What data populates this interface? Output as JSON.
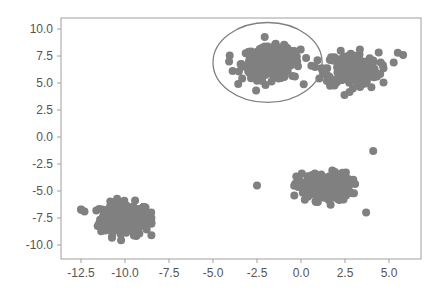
{
  "chart_data": {
    "type": "scatter",
    "title": "",
    "xlabel": "",
    "ylabel": "",
    "xlim": [
      -13.6,
      6.8
    ],
    "ylim": [
      -11.2,
      11.0
    ],
    "grid": false,
    "legend": null,
    "x_ticks": [
      "-12.5",
      "-10.0",
      "-7.5",
      "-5.0",
      "-2.5",
      "0.0",
      "2.5",
      "5.0"
    ],
    "y_ticks": [
      "10.0",
      "7.5",
      "5.0",
      "2.5",
      "0.0",
      "-2.5",
      "-5.0",
      "-7.5",
      "-10.0"
    ],
    "x_tick_values": [
      -12.5,
      -10.0,
      -7.5,
      -5.0,
      -2.5,
      0.0,
      2.5,
      5.0
    ],
    "y_tick_values": [
      10.0,
      7.5,
      5.0,
      2.5,
      0.0,
      -2.5,
      -5.0,
      -7.5,
      -10.0
    ],
    "point_color": "#808080",
    "frame_color": "#a0a0a0",
    "clusters": [
      {
        "name": "cluster-1",
        "center": [
          -10.0,
          -7.6
        ],
        "spread": [
          0.95,
          1.0
        ],
        "count": 220,
        "x_range": [
          -12.7,
          -8.5
        ],
        "y_range": [
          -10.0,
          -5.0
        ]
      },
      {
        "name": "cluster-2",
        "center": [
          -1.7,
          6.8
        ],
        "spread": [
          1.1,
          1.0
        ],
        "count": 250,
        "x_range": [
          -4.4,
          0.9
        ],
        "y_range": [
          4.3,
          9.4
        ]
      },
      {
        "name": "cluster-3",
        "center": [
          2.9,
          6.3
        ],
        "spread": [
          1.0,
          1.0
        ],
        "count": 250,
        "x_range": [
          0.8,
          5.8
        ],
        "y_range": [
          3.9,
          9.9
        ]
      },
      {
        "name": "cluster-4",
        "center": [
          1.3,
          -4.6
        ],
        "spread": [
          1.0,
          0.85
        ],
        "count": 230,
        "x_range": [
          -2.5,
          4.2
        ],
        "y_range": [
          -7.2,
          -1.3
        ]
      }
    ],
    "outliers": [
      [
        4.1,
        -1.3
      ],
      [
        -2.5,
        -4.5
      ],
      [
        3.7,
        -7.0
      ],
      [
        -12.5,
        -6.7
      ],
      [
        -12.3,
        -6.9
      ],
      [
        -8.5,
        -7.5
      ],
      [
        4.0,
        4.6
      ],
      [
        5.8,
        7.6
      ],
      [
        5.5,
        7.8
      ]
    ],
    "annotations": [
      {
        "type": "ellipse",
        "center": [
          -1.9,
          6.9
        ],
        "width": 6.2,
        "height": 7.4,
        "stroke": "#808080",
        "fill": "none",
        "label": ""
      }
    ]
  }
}
